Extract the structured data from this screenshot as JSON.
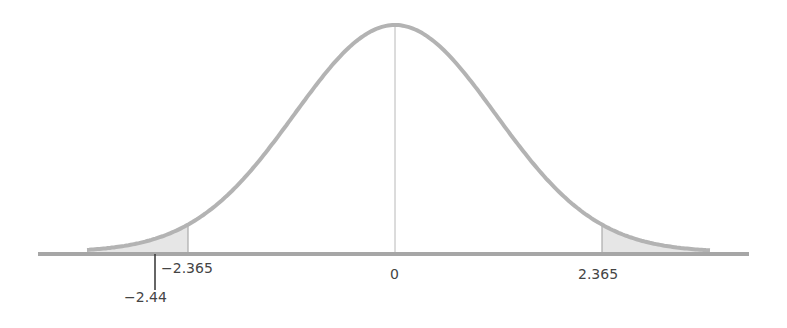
{
  "chart_data": {
    "type": "area",
    "title": "",
    "xlabel": "",
    "ylabel": "",
    "center": 0,
    "critical_values": [
      -2.365,
      2.365
    ],
    "test_statistic": -2.44,
    "tick_labels": [
      "-2.365",
      "0",
      "2.365",
      "-2.44"
    ],
    "shaded_regions": [
      {
        "from": "-inf",
        "to": -2.365,
        "name": "left tail"
      },
      {
        "from": 2.365,
        "to": "inf",
        "name": "right tail"
      }
    ],
    "xlim": [
      -3.6,
      3.6
    ],
    "grid": false,
    "legend": null
  },
  "labels": {
    "left_critical": "−2.365",
    "center": "0",
    "right_critical": "2.365",
    "test_stat": "−2.44"
  },
  "colors": {
    "curve": "#b3b3b3",
    "axis": "#a6a6a6",
    "shade": "#e6e6e6",
    "text": "#444444"
  }
}
